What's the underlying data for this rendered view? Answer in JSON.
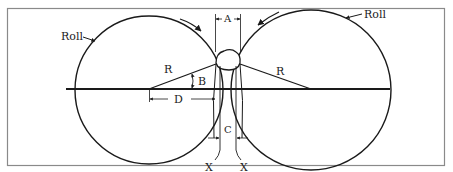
{
  "figure": {
    "type": "roll-compaction-diagram",
    "frame": {
      "border_color": "#8a8a8a",
      "background": "#ffffff"
    },
    "line_color": "#1a1a1a",
    "labels": {
      "roll_left": "Roll",
      "roll_right": "Roll",
      "gap_top": "A",
      "angle": "B",
      "nip_gap": "C",
      "distance": "D",
      "radius_left": "R",
      "radius_right": "R",
      "ref_left": "X",
      "ref_right": "X"
    },
    "rolls": [
      {
        "name": "left-roll",
        "rotation": "clockwise"
      },
      {
        "name": "right-roll",
        "rotation": "counter-clockwise"
      }
    ]
  }
}
